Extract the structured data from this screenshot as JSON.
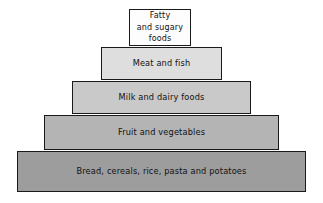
{
  "diagram": {
    "type": "food-pyramid",
    "orientation": "apex-top",
    "tier_count": 5,
    "background_color": "#ffffff",
    "border_color": "#1a1a1a",
    "text_color": "#111111",
    "tiers": [
      {
        "index": 1,
        "position": "apex",
        "label": "Fatty\nand sugary\nfoods",
        "label_lines": [
          "Fatty",
          "and sugary",
          "foods"
        ],
        "fill_color": "#fdfdfd"
      },
      {
        "index": 2,
        "position": "second",
        "label": "Meat and fish",
        "label_lines": [
          "Meat and fish"
        ],
        "fill_color": "#dedede"
      },
      {
        "index": 3,
        "position": "middle",
        "label": "Milk and dairy foods",
        "label_lines": [
          "Milk and dairy foods"
        ],
        "fill_color": "#c9c9c9"
      },
      {
        "index": 4,
        "position": "fourth",
        "label": "Fruit and vegetables",
        "label_lines": [
          "Fruit and vegetables"
        ],
        "fill_color": "#b4b4b4"
      },
      {
        "index": 5,
        "position": "base",
        "label": "Bread, cereals, rice, pasta and potatoes",
        "label_lines": [
          "Bread, cereals, rice, pasta and potatoes"
        ],
        "fill_color": "#9d9d9d"
      }
    ]
  }
}
